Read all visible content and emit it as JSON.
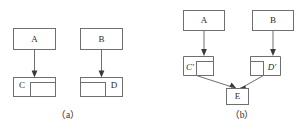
{
  "figure": {
    "background_color": "#ffffff",
    "stroke_color": "#6f6f6f",
    "text_color": "#2b2b2b",
    "arrow_color": "#3a3a3a",
    "width": 301,
    "height": 130
  },
  "panel_a": {
    "caption": "（a）",
    "nodes": {
      "a": "A",
      "b": "B",
      "c": "C",
      "d": "D"
    }
  },
  "panel_b": {
    "caption": "（b）",
    "nodes": {
      "a": "A",
      "b": "B",
      "c_prime": "C′",
      "d_prime": "D′",
      "e": "E"
    }
  }
}
